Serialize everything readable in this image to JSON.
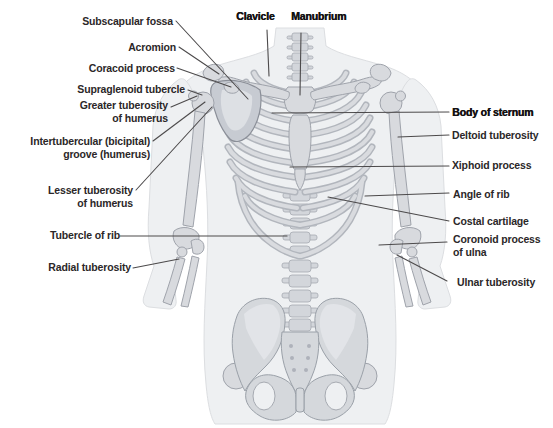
{
  "figure": {
    "kind": "anatomical-diagram",
    "view": "anterior torso skeleton"
  },
  "labels": {
    "left": [
      {
        "text": "Subscapular fossa",
        "bold": false
      },
      {
        "text": "Acromion",
        "bold": false
      },
      {
        "text": "Coracoid process",
        "bold": false
      },
      {
        "text": "Supraglenoid tubercle",
        "bold": false
      },
      {
        "text": "Greater tuberosity\nof humerus",
        "bold": false
      },
      {
        "text": "Intertubercular (bicipital)\ngroove (humerus)",
        "bold": false
      },
      {
        "text": "Lesser tuberosity\nof humerus",
        "bold": false
      },
      {
        "text": "Tubercle of rib",
        "bold": false
      },
      {
        "text": "Radial tuberosity",
        "bold": false
      }
    ],
    "top": [
      {
        "text": "Clavicle",
        "bold": true
      },
      {
        "text": "Manubrium",
        "bold": true
      }
    ],
    "right": [
      {
        "text": "Body of sternum",
        "bold": true
      },
      {
        "text": "Deltoid tuberosity",
        "bold": false
      },
      {
        "text": "Xiphoid process",
        "bold": false
      },
      {
        "text": "Angle of rib",
        "bold": false
      },
      {
        "text": "Costal cartilage",
        "bold": false
      },
      {
        "text": "Coronoid process\nof ulna",
        "bold": false
      },
      {
        "text": "Ulnar tuberosity",
        "bold": false
      }
    ]
  },
  "colors": {
    "background": "#ffffff",
    "label_text": "#2b2728",
    "label_text_bold": "#141112",
    "leader_line": "#4c4a4b",
    "silhouette": "#eef0f2",
    "silhouette_edge": "#dcdee1",
    "bone_fill": "#d8dade",
    "bone_outline": "#9fa3ab",
    "bone_shadow": "#b2b6bd",
    "scapula_fill": "#c7cbd2"
  }
}
